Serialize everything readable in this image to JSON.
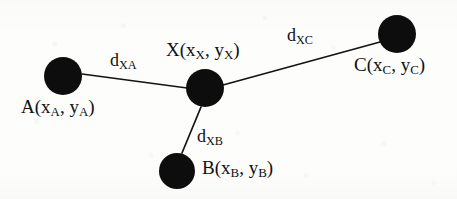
{
  "figure": {
    "type": "node-link-diagram",
    "width": 457,
    "height": 199,
    "background_color": "#fdfdfc",
    "ink_color": "#111111"
  },
  "nodes": [
    {
      "id": "A",
      "label_letter": "A",
      "label_coords": "(x_A, y_A)",
      "label_text": "A(xA, yA)",
      "cx": 63,
      "cy": 76,
      "r": 19,
      "fill": "#0d0d0d",
      "label_x": 21,
      "label_y": 97
    },
    {
      "id": "X",
      "label_letter": "X",
      "label_coords": "(x_X, y_X)",
      "label_text": "X(xX, yX)",
      "cx": 205,
      "cy": 88,
      "r": 19,
      "fill": "#0d0d0d",
      "label_x": 166,
      "label_y": 40
    },
    {
      "id": "B",
      "label_letter": "B",
      "label_coords": "(x_B, y_B)",
      "label_text": "B(xB, yB)",
      "cx": 177,
      "cy": 171,
      "r": 18,
      "fill": "#0d0d0d",
      "label_x": 202,
      "label_y": 158
    },
    {
      "id": "C",
      "label_letter": "C",
      "label_coords": "(x_C, y_C)",
      "label_text": "C(xC, yC)",
      "cx": 397,
      "cy": 34,
      "r": 19,
      "fill": "#0d0d0d",
      "label_x": 354,
      "label_y": 55
    }
  ],
  "edges": [
    {
      "id": "XA",
      "from": "X",
      "to": "A",
      "label_letter": "d",
      "label_sub": "XA",
      "label_text": "dXA",
      "x1": 82,
      "y1": 74,
      "x2": 187,
      "y2": 88,
      "label_x": 110,
      "label_y": 51
    },
    {
      "id": "XB",
      "from": "X",
      "to": "B",
      "label_letter": "d",
      "label_sub": "XB",
      "label_text": "dXB",
      "x1": 201,
      "y1": 107,
      "x2": 182,
      "y2": 153,
      "label_x": 197,
      "label_y": 127
    },
    {
      "id": "XC",
      "from": "X",
      "to": "C",
      "label_letter": "d",
      "label_sub": "XC",
      "label_text": "dXC",
      "x1": 223,
      "y1": 85,
      "x2": 380,
      "y2": 42,
      "label_x": 287,
      "label_y": 26
    }
  ]
}
